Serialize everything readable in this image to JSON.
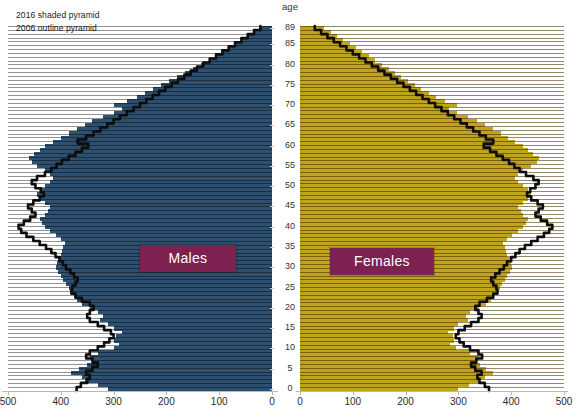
{
  "legend": {
    "line1": "2016 shaded pyramid",
    "line2": "2006 outline pyramid"
  },
  "age_caption": "age",
  "series_labels": {
    "males": "Males",
    "females": "Females"
  },
  "colors": {
    "male_bar": "#2d4f70",
    "female_bar": "#c0a41c",
    "outline": "#0d0d0d",
    "label_box": "#7d2150"
  },
  "chart_data": {
    "type": "bar",
    "title": "",
    "subtitle": "",
    "xlabel": "",
    "ylabel": "age",
    "grid": false,
    "legend_position": "top-left",
    "orientation": "horizontal",
    "layout": "population-pyramid",
    "age_tick_labels": [
      "89",
      "85",
      "80",
      "75",
      "70",
      "65",
      "60",
      "55",
      "50",
      "45",
      "40",
      "35",
      "30",
      "25",
      "20",
      "15",
      "10",
      "5",
      "0"
    ],
    "male_xticks": [
      500,
      400,
      300,
      200,
      100,
      0
    ],
    "female_xticks": [
      0,
      100,
      200,
      300,
      400,
      500
    ],
    "xlim": [
      0,
      500
    ],
    "ages": [
      0,
      1,
      2,
      3,
      4,
      5,
      6,
      7,
      8,
      9,
      10,
      11,
      12,
      13,
      14,
      15,
      16,
      17,
      18,
      19,
      20,
      21,
      22,
      23,
      24,
      25,
      26,
      27,
      28,
      29,
      30,
      31,
      32,
      33,
      34,
      35,
      36,
      37,
      38,
      39,
      40,
      41,
      42,
      43,
      44,
      45,
      46,
      47,
      48,
      49,
      50,
      51,
      52,
      53,
      54,
      55,
      56,
      57,
      58,
      59,
      60,
      61,
      62,
      63,
      64,
      65,
      66,
      67,
      68,
      69,
      70,
      71,
      72,
      73,
      74,
      75,
      76,
      77,
      78,
      79,
      80,
      81,
      82,
      83,
      84,
      85,
      86,
      87,
      88,
      89
    ],
    "series": [
      {
        "name": "Males 2016 (shaded)",
        "side": "left",
        "style": "shaded-bars",
        "color": "#2d4f70",
        "values": [
          310,
          330,
          355,
          360,
          380,
          365,
          350,
          340,
          345,
          330,
          300,
          290,
          300,
          295,
          285,
          300,
          310,
          325,
          320,
          330,
          345,
          360,
          370,
          375,
          380,
          385,
          390,
          395,
          400,
          405,
          410,
          408,
          405,
          400,
          398,
          395,
          392,
          400,
          410,
          420,
          430,
          435,
          440,
          430,
          425,
          420,
          430,
          440,
          445,
          440,
          430,
          420,
          415,
          420,
          430,
          445,
          455,
          460,
          450,
          440,
          430,
          415,
          400,
          385,
          370,
          355,
          340,
          320,
          300,
          285,
          300,
          275,
          255,
          240,
          225,
          210,
          195,
          180,
          165,
          150,
          135,
          120,
          105,
          92,
          80,
          68,
          56,
          45,
          34,
          24
        ]
      },
      {
        "name": "Females 2016 (shaded)",
        "side": "right",
        "style": "shaded-bars",
        "color": "#c0a41c",
        "values": [
          300,
          320,
          340,
          350,
          365,
          352,
          340,
          335,
          338,
          322,
          295,
          285,
          292,
          290,
          280,
          292,
          300,
          318,
          315,
          322,
          338,
          352,
          362,
          368,
          372,
          378,
          382,
          388,
          392,
          398,
          402,
          400,
          398,
          392,
          390,
          388,
          385,
          392,
          402,
          412,
          422,
          428,
          432,
          422,
          418,
          412,
          422,
          432,
          438,
          432,
          422,
          412,
          408,
          412,
          422,
          438,
          448,
          452,
          442,
          432,
          422,
          408,
          394,
          380,
          366,
          350,
          336,
          318,
          298,
          282,
          298,
          275,
          258,
          244,
          230,
          218,
          204,
          192,
          180,
          168,
          155,
          142,
          130,
          118,
          106,
          94,
          82,
          70,
          58,
          46
        ]
      },
      {
        "name": "Males 2006 (outline)",
        "side": "left",
        "style": "outline",
        "color": "#0d0d0d",
        "values": [
          370,
          362,
          350,
          345,
          352,
          340,
          330,
          340,
          352,
          345,
          330,
          318,
          308,
          300,
          305,
          318,
          330,
          345,
          350,
          345,
          338,
          345,
          360,
          372,
          380,
          378,
          372,
          368,
          375,
          382,
          390,
          396,
          402,
          410,
          418,
          428,
          440,
          452,
          465,
          475,
          480,
          470,
          458,
          448,
          455,
          462,
          452,
          440,
          432,
          438,
          448,
          455,
          445,
          430,
          418,
          408,
          398,
          385,
          372,
          360,
          348,
          368,
          352,
          338,
          325,
          312,
          300,
          288,
          275,
          262,
          250,
          238,
          226,
          214,
          202,
          190,
          178,
          166,
          154,
          142,
          130,
          118,
          106,
          94,
          82,
          70,
          58,
          46,
          34,
          22
        ]
      },
      {
        "name": "Females 2006 (outline)",
        "side": "right",
        "style": "outline",
        "color": "#0d0d0d",
        "values": [
          358,
          350,
          340,
          336,
          344,
          332,
          324,
          334,
          345,
          338,
          322,
          310,
          302,
          295,
          300,
          312,
          324,
          338,
          344,
          338,
          332,
          340,
          354,
          366,
          374,
          372,
          366,
          362,
          370,
          378,
          386,
          392,
          400,
          408,
          416,
          426,
          438,
          450,
          462,
          472,
          478,
          468,
          456,
          446,
          452,
          460,
          450,
          438,
          430,
          436,
          446,
          452,
          442,
          428,
          416,
          406,
          396,
          384,
          372,
          360,
          348,
          366,
          352,
          340,
          328,
          316,
          304,
          292,
          280,
          268,
          256,
          244,
          232,
          220,
          208,
          196,
          184,
          172,
          160,
          148,
          136,
          124,
          112,
          100,
          88,
          76,
          64,
          52,
          40,
          28
        ]
      }
    ]
  }
}
